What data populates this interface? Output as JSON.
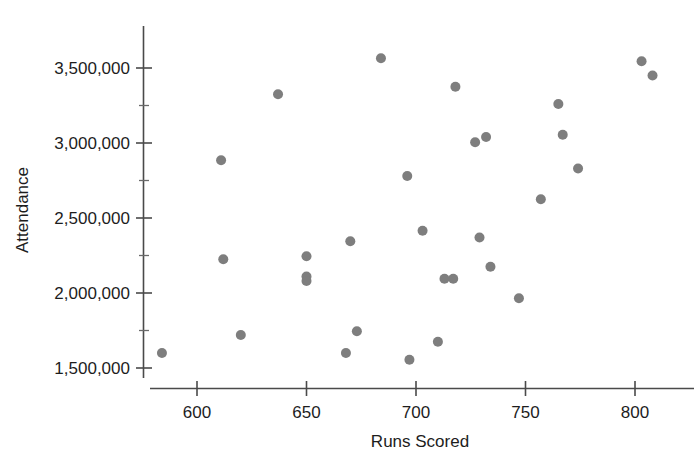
{
  "chart_data": {
    "type": "scatter",
    "title": "",
    "xlabel": "Runs Scored",
    "ylabel": "Attendance",
    "xlim": [
      578,
      816
    ],
    "ylim": [
      1430000,
      3640000
    ],
    "xticks": [
      600,
      650,
      700,
      750,
      800
    ],
    "xtick_labels": [
      "600",
      "650",
      "700",
      "750",
      "800"
    ],
    "yticks": [
      1500000,
      2000000,
      2500000,
      3000000,
      3500000
    ],
    "ytick_labels": [
      "1,500,000",
      "2,000,000",
      "2,500,000",
      "3,000,000",
      "3,500,000"
    ],
    "yticks_minor": [
      1750000,
      2250000,
      2750000,
      3250000
    ],
    "grid": false,
    "legend": null,
    "marker": {
      "shape": "circle",
      "color": "#7e7e7e",
      "radius_px": 5
    },
    "points": [
      {
        "x": 584,
        "y": 1600000
      },
      {
        "x": 611,
        "y": 2885000
      },
      {
        "x": 612,
        "y": 2225000
      },
      {
        "x": 620,
        "y": 1720000
      },
      {
        "x": 637,
        "y": 3325000
      },
      {
        "x": 650,
        "y": 2245000
      },
      {
        "x": 650,
        "y": 2110000
      },
      {
        "x": 650,
        "y": 2080000
      },
      {
        "x": 668,
        "y": 1600000
      },
      {
        "x": 670,
        "y": 2345000
      },
      {
        "x": 673,
        "y": 1745000
      },
      {
        "x": 684,
        "y": 3565000
      },
      {
        "x": 696,
        "y": 2780000
      },
      {
        "x": 697,
        "y": 1555000
      },
      {
        "x": 703,
        "y": 2415000
      },
      {
        "x": 710,
        "y": 1675000
      },
      {
        "x": 713,
        "y": 2095000
      },
      {
        "x": 717,
        "y": 2095000
      },
      {
        "x": 718,
        "y": 3375000
      },
      {
        "x": 727,
        "y": 3005000
      },
      {
        "x": 729,
        "y": 2370000
      },
      {
        "x": 732,
        "y": 3040000
      },
      {
        "x": 734,
        "y": 2175000
      },
      {
        "x": 747,
        "y": 1965000
      },
      {
        "x": 757,
        "y": 2625000
      },
      {
        "x": 765,
        "y": 3260000
      },
      {
        "x": 767,
        "y": 3055000
      },
      {
        "x": 774,
        "y": 2830000
      },
      {
        "x": 803,
        "y": 3545000
      },
      {
        "x": 808,
        "y": 3450000
      }
    ]
  },
  "axes": {
    "y_axis_name": "attendance-axis",
    "x_axis_name": "runs-scored-axis"
  }
}
